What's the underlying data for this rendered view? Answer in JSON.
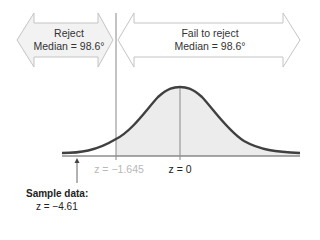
{
  "diagram": {
    "reject_region": {
      "line1": "Reject",
      "line2": "Median = 98.6°"
    },
    "fail_region": {
      "line1": "Fail to reject",
      "line2": "Median = 98.6°"
    },
    "critical_value_label": "z = −1.645",
    "center_label": "z = 0",
    "sample": {
      "title": "Sample data:",
      "value": "z = −4.61"
    },
    "colors": {
      "curve": "#404040",
      "fill": "#ececec",
      "arrow_fill": "#f2f2f2",
      "arrow_stroke": "#c4c4c4",
      "lines": "#888888",
      "dim_text": "#b8b8b8"
    }
  }
}
